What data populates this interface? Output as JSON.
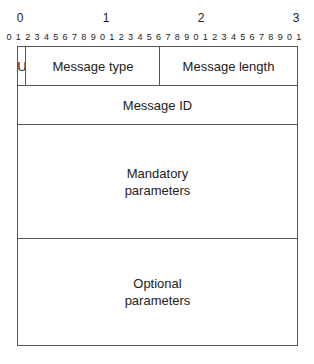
{
  "ruler": {
    "major": [
      "0",
      "1",
      "2",
      "3"
    ],
    "minor": [
      "0",
      "1",
      "2",
      "3",
      "4",
      "5",
      "6",
      "7",
      "8",
      "9",
      "0",
      "1",
      "2",
      "3",
      "4",
      "5",
      "6",
      "7",
      "8",
      "9",
      "0",
      "1",
      "2",
      "3",
      "4",
      "5",
      "6",
      "7",
      "8",
      "9",
      "0",
      "1"
    ]
  },
  "fields": {
    "u_flag": "U",
    "message_type": "Message type",
    "message_length": "Message length",
    "message_id": "Message ID",
    "mandatory_line1": "Mandatory",
    "mandatory_line2": "parameters",
    "optional_line1": "Optional",
    "optional_line2": "parameters"
  }
}
